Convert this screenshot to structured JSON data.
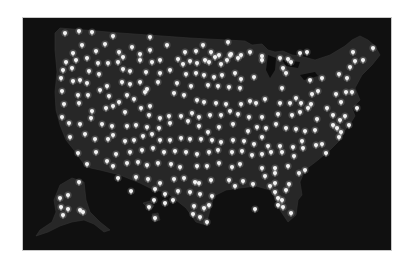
{
  "map": {
    "title": "",
    "region": "United States",
    "background_color": "#ffffff",
    "frame_color": "#101010",
    "land_color": "#272727",
    "pin_color": "#f2f2f2",
    "pin_icon": "map-pin-icon",
    "pins_contiguous": [
      [
        65,
        33
      ],
      [
        79,
        31
      ],
      [
        92,
        32
      ],
      [
        113,
        36
      ],
      [
        150,
        37
      ],
      [
        82,
        45
      ],
      [
        105,
        44
      ],
      [
        132,
        47
      ],
      [
        167,
        45
      ],
      [
        203,
        45
      ],
      [
        228,
        42
      ],
      [
        73,
        53
      ],
      [
        96,
        51
      ],
      [
        119,
        52
      ],
      [
        123,
        57
      ],
      [
        140,
        54
      ],
      [
        150,
        50
      ],
      [
        185,
        52
      ],
      [
        196,
        51
      ],
      [
        211,
        52
      ],
      [
        219,
        55
      ],
      [
        231,
        54
      ],
      [
        238,
        58
      ],
      [
        262,
        56
      ],
      [
        300,
        53
      ],
      [
        307,
        52
      ],
      [
        353,
        52
      ],
      [
        373,
        48
      ],
      [
        66,
        62
      ],
      [
        76,
        60
      ],
      [
        87,
        58
      ],
      [
        98,
        63
      ],
      [
        108,
        63
      ],
      [
        118,
        62
      ],
      [
        140,
        60
      ],
      [
        152,
        62
      ],
      [
        160,
        60
      ],
      [
        178,
        59
      ],
      [
        183,
        64
      ],
      [
        190,
        61
      ],
      [
        197,
        63
      ],
      [
        205,
        60
      ],
      [
        209,
        62
      ],
      [
        215,
        57
      ],
      [
        221,
        64
      ],
      [
        227,
        60
      ],
      [
        230,
        55
      ],
      [
        241,
        55
      ],
      [
        250,
        52
      ],
      [
        262,
        60
      ],
      [
        280,
        58
      ],
      [
        288,
        59
      ],
      [
        291,
        62
      ],
      [
        355,
        61
      ],
      [
        363,
        60
      ],
      [
        63,
        70
      ],
      [
        72,
        68
      ],
      [
        89,
        71
      ],
      [
        99,
        74
      ],
      [
        123,
        69
      ],
      [
        130,
        71
      ],
      [
        146,
        72
      ],
      [
        160,
        73
      ],
      [
        170,
        70
      ],
      [
        186,
        74
      ],
      [
        196,
        73
      ],
      [
        204,
        75
      ],
      [
        214,
        77
      ],
      [
        222,
        75
      ],
      [
        235,
        73
      ],
      [
        241,
        79
      ],
      [
        254,
        77
      ],
      [
        283,
        68
      ],
      [
        286,
        73
      ],
      [
        322,
        78
      ],
      [
        347,
        78
      ],
      [
        339,
        74
      ],
      [
        350,
        67
      ],
      [
        61,
        78
      ],
      [
        73,
        81
      ],
      [
        80,
        80
      ],
      [
        87,
        83
      ],
      [
        107,
        86
      ],
      [
        122,
        82
      ],
      [
        130,
        84
      ],
      [
        140,
        82
      ],
      [
        147,
        89
      ],
      [
        158,
        82
      ],
      [
        177,
        83
      ],
      [
        191,
        86
      ],
      [
        208,
        85
      ],
      [
        218,
        86
      ],
      [
        229,
        87
      ],
      [
        240,
        88
      ],
      [
        282,
        88
      ],
      [
        310,
        80
      ],
      [
        312,
        94
      ],
      [
        318,
        91
      ],
      [
        336,
        94
      ],
      [
        346,
        92
      ],
      [
        352,
        92
      ],
      [
        62,
        91
      ],
      [
        78,
        95
      ],
      [
        88,
        95
      ],
      [
        100,
        90
      ],
      [
        109,
        96
      ],
      [
        119,
        102
      ],
      [
        127,
        95
      ],
      [
        134,
        99
      ],
      [
        145,
        92
      ],
      [
        150,
        106
      ],
      [
        174,
        93
      ],
      [
        184,
        95
      ],
      [
        197,
        100
      ],
      [
        204,
        102
      ],
      [
        216,
        103
      ],
      [
        226,
        104
      ],
      [
        241,
        104
      ],
      [
        250,
        101
      ],
      [
        256,
        103
      ],
      [
        265,
        99
      ],
      [
        280,
        103
      ],
      [
        290,
        103
      ],
      [
        296,
        98
      ],
      [
        301,
        103
      ],
      [
        311,
        104
      ],
      [
        327,
        108
      ],
      [
        341,
        102
      ],
      [
        357,
        108
      ],
      [
        64,
        104
      ],
      [
        79,
        103
      ],
      [
        92,
        111
      ],
      [
        106,
        108
      ],
      [
        113,
        106
      ],
      [
        125,
        112
      ],
      [
        141,
        108
      ],
      [
        149,
        115
      ],
      [
        160,
        118
      ],
      [
        169,
        116
      ],
      [
        181,
        116
      ],
      [
        192,
        113
      ],
      [
        199,
        117
      ],
      [
        210,
        115
      ],
      [
        221,
        115
      ],
      [
        230,
        111
      ],
      [
        238,
        114
      ],
      [
        249,
        117
      ],
      [
        262,
        117
      ],
      [
        278,
        114
      ],
      [
        292,
        115
      ],
      [
        300,
        112
      ],
      [
        308,
        108
      ],
      [
        317,
        119
      ],
      [
        333,
        115
      ],
      [
        340,
        120
      ],
      [
        345,
        116
      ],
      [
        349,
        125
      ],
      [
        62,
        117
      ],
      [
        69,
        123
      ],
      [
        80,
        124
      ],
      [
        91,
        118
      ],
      [
        102,
        124
      ],
      [
        112,
        126
      ],
      [
        127,
        126
      ],
      [
        136,
        125
      ],
      [
        147,
        127
      ],
      [
        159,
        128
      ],
      [
        170,
        123
      ],
      [
        188,
        121
      ],
      [
        199,
        126
      ],
      [
        208,
        132
      ],
      [
        219,
        127
      ],
      [
        233,
        124
      ],
      [
        248,
        131
      ],
      [
        257,
        127
      ],
      [
        266,
        128
      ],
      [
        276,
        124
      ],
      [
        286,
        128
      ],
      [
        296,
        129
      ],
      [
        305,
        131
      ],
      [
        315,
        130
      ],
      [
        333,
        125
      ],
      [
        337,
        128
      ],
      [
        341,
        132
      ],
      [
        70,
        137
      ],
      [
        85,
        134
      ],
      [
        95,
        139
      ],
      [
        108,
        139
      ],
      [
        113,
        135
      ],
      [
        125,
        141
      ],
      [
        134,
        140
      ],
      [
        143,
        136
      ],
      [
        152,
        134
      ],
      [
        160,
        140
      ],
      [
        170,
        140
      ],
      [
        181,
        138
      ],
      [
        190,
        139
      ],
      [
        201,
        139
      ],
      [
        212,
        140
      ],
      [
        221,
        142
      ],
      [
        233,
        140
      ],
      [
        244,
        141
      ],
      [
        254,
        144
      ],
      [
        262,
        137
      ],
      [
        268,
        146
      ],
      [
        280,
        146
      ],
      [
        293,
        147
      ],
      [
        302,
        141
      ],
      [
        316,
        145
      ],
      [
        322,
        144
      ],
      [
        339,
        137
      ],
      [
        78,
        153
      ],
      [
        96,
        152
      ],
      [
        116,
        154
      ],
      [
        130,
        152
      ],
      [
        142,
        150
      ],
      [
        153,
        148
      ],
      [
        164,
        152
      ],
      [
        175,
        151
      ],
      [
        186,
        152
      ],
      [
        197,
        154
      ],
      [
        209,
        152
      ],
      [
        218,
        150
      ],
      [
        232,
        152
      ],
      [
        242,
        151
      ],
      [
        252,
        155
      ],
      [
        262,
        154
      ],
      [
        271,
        152
      ],
      [
        282,
        152
      ],
      [
        294,
        156
      ],
      [
        303,
        148
      ],
      [
        326,
        153
      ],
      [
        87,
        164
      ],
      [
        107,
        161
      ],
      [
        113,
        166
      ],
      [
        127,
        163
      ],
      [
        138,
        162
      ],
      [
        147,
        165
      ],
      [
        158,
        163
      ],
      [
        171,
        164
      ],
      [
        180,
        167
      ],
      [
        197,
        166
      ],
      [
        207,
        166
      ],
      [
        219,
        163
      ],
      [
        232,
        167
      ],
      [
        240,
        164
      ],
      [
        262,
        168
      ],
      [
        275,
        168
      ],
      [
        288,
        166
      ],
      [
        305,
        170
      ],
      [
        118,
        178
      ],
      [
        136,
        177
      ],
      [
        148,
        179
      ],
      [
        160,
        183
      ],
      [
        174,
        179
      ],
      [
        184,
        178
      ],
      [
        195,
        182
      ],
      [
        199,
        183
      ],
      [
        211,
        180
      ],
      [
        229,
        180
      ],
      [
        243,
        181
      ],
      [
        265,
        176
      ],
      [
        275,
        173
      ],
      [
        299,
        173
      ],
      [
        131,
        191
      ],
      [
        155,
        189
      ],
      [
        165,
        194
      ],
      [
        178,
        191
      ],
      [
        190,
        192
      ],
      [
        200,
        194
      ],
      [
        212,
        196
      ],
      [
        235,
        186
      ],
      [
        253,
        184
      ],
      [
        270,
        186
      ],
      [
        275,
        183
      ],
      [
        289,
        184
      ],
      [
        154,
        200
      ],
      [
        165,
        203
      ],
      [
        173,
        200
      ],
      [
        194,
        206
      ],
      [
        204,
        208
      ],
      [
        209,
        205
      ],
      [
        255,
        209
      ],
      [
        275,
        192
      ],
      [
        278,
        198
      ],
      [
        282,
        200
      ],
      [
        286,
        190
      ],
      [
        193,
        214
      ],
      [
        200,
        217
      ],
      [
        207,
        222
      ],
      [
        278,
        205
      ],
      [
        283,
        207
      ],
      [
        291,
        213
      ]
    ],
    "pins_alaska": [
      [
        79,
        182
      ],
      [
        68,
        195
      ],
      [
        60,
        198
      ],
      [
        61,
        207
      ],
      [
        68,
        209
      ],
      [
        63,
        215
      ],
      [
        80,
        210
      ],
      [
        83,
        212
      ]
    ],
    "pins_hawaii": [
      [
        149,
        207
      ],
      [
        155,
        218
      ]
    ]
  }
}
